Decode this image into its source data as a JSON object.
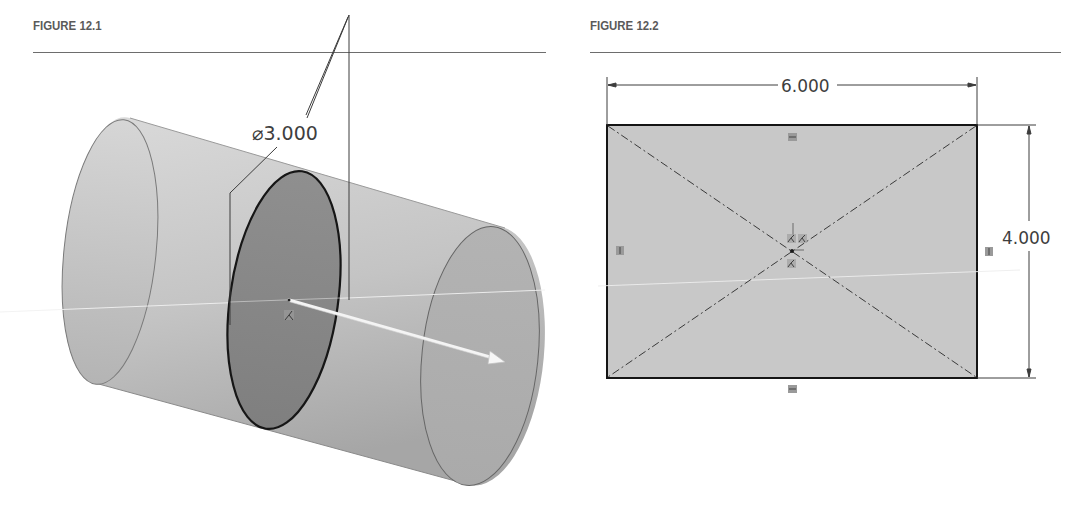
{
  "figures": [
    {
      "id": "figure-12-1",
      "title": "FIGURE 12.1",
      "description": "Isometric view of a cylinder extruded from a circular sketch with a direction arrow",
      "dimension": {
        "symbol": "⌀",
        "value": "3.000",
        "label": "⌀3.000"
      }
    },
    {
      "id": "figure-12-2",
      "title": "FIGURE 12.2",
      "description": "Rectangle sketch with diagonal construction lines and horizontal/vertical relation markers",
      "dimensions": {
        "width": "6.000",
        "height": "4.000"
      }
    }
  ],
  "colors": {
    "cylinder_fill_light": "#cfcfcf",
    "cylinder_fill_dark": "#a9a9a9",
    "sketch_ellipse_fill": "#8c8c8c",
    "rectangle_fill": "#c9c9c9",
    "line_dark": "#1e1e1e",
    "dimension_line": "#4a4a4a",
    "header_text": "#5a5a5a"
  }
}
